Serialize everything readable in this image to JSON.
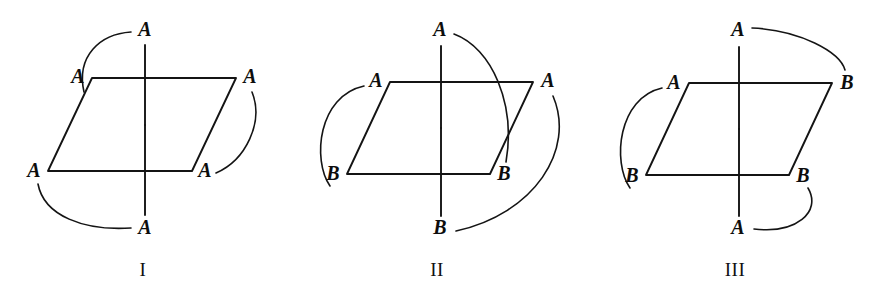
{
  "figure": {
    "background_color": "#ffffff",
    "ink_color": "#141414"
  },
  "structures": [
    {
      "id": "structure-1",
      "caption": "I",
      "caption_pos": {
        "x": 143,
        "y": 272
      },
      "plane": {
        "top_left": {
          "x": 92,
          "y": 78
        },
        "top_right": {
          "x": 236,
          "y": 78
        },
        "bottom_right": {
          "x": 192,
          "y": 171
        },
        "bottom_left": {
          "x": 48,
          "y": 171
        }
      },
      "axis": {
        "center": {
          "x": 145,
          "y": 125
        },
        "top_end": {
          "x": 145,
          "y": 45
        },
        "bottom_end": {
          "x": 145,
          "y": 215
        }
      },
      "labels": [
        {
          "name": "apex-top",
          "text": "A",
          "x": 145,
          "y": 31
        },
        {
          "name": "vertex-top-left",
          "text": "A",
          "x": 78,
          "y": 78
        },
        {
          "name": "vertex-top-right",
          "text": "A",
          "x": 250,
          "y": 78
        },
        {
          "name": "vertex-bottom-left",
          "text": "A",
          "x": 34,
          "y": 172
        },
        {
          "name": "vertex-bottom-right",
          "text": "A",
          "x": 205,
          "y": 172
        },
        {
          "name": "apex-bottom",
          "text": "A",
          "x": 145,
          "y": 229
        }
      ],
      "arcs": [
        {
          "name": "arc-topleft-to-apex-top",
          "d": "M 84 92 C 76 56, 100 34, 131 32"
        },
        {
          "name": "arc-topright-to-bottomright",
          "d": "M 252 92 C 264 122, 246 160, 216 173"
        },
        {
          "name": "arc-bottomleft-to-apex-bottom",
          "d": "M 38 184 C 44 216, 84 231, 131 228"
        }
      ]
    },
    {
      "id": "structure-2",
      "caption": "II",
      "caption_pos": {
        "x": 437,
        "y": 272
      },
      "plane": {
        "top_left": {
          "x": 390,
          "y": 82
        },
        "top_right": {
          "x": 533,
          "y": 82
        },
        "bottom_right": {
          "x": 490,
          "y": 174
        },
        "bottom_left": {
          "x": 347,
          "y": 174
        }
      },
      "axis": {
        "center": {
          "x": 441,
          "y": 128
        },
        "top_end": {
          "x": 441,
          "y": 46
        },
        "bottom_end": {
          "x": 441,
          "y": 216
        }
      },
      "labels": [
        {
          "name": "apex-top",
          "text": "A",
          "x": 440,
          "y": 31
        },
        {
          "name": "vertex-top-left",
          "text": "A",
          "x": 376,
          "y": 82
        },
        {
          "name": "vertex-top-right",
          "text": "A",
          "x": 548,
          "y": 82
        },
        {
          "name": "vertex-bottom-left",
          "text": "B",
          "x": 333,
          "y": 175
        },
        {
          "name": "vertex-bottom-right",
          "text": "B",
          "x": 504,
          "y": 175
        },
        {
          "name": "apex-bottom",
          "text": "B",
          "x": 440,
          "y": 229
        }
      ],
      "arcs": [
        {
          "name": "arc-apex-top-to-bottomright",
          "d": "M 454 34 C 492 48, 516 104, 506 162"
        },
        {
          "name": "arc-topleft-to-bottomleft",
          "d": "M 364 86 C 318 96, 312 160, 330 186"
        },
        {
          "name": "arc-topright-to-apex-bottom",
          "d": "M 553 96 C 576 150, 534 214, 456 231"
        }
      ]
    },
    {
      "id": "structure-3",
      "caption": "III",
      "caption_pos": {
        "x": 735,
        "y": 272
      },
      "plane": {
        "top_left": {
          "x": 689,
          "y": 83
        },
        "top_right": {
          "x": 832,
          "y": 83
        },
        "bottom_right": {
          "x": 789,
          "y": 175
        },
        "bottom_left": {
          "x": 646,
          "y": 175
        }
      },
      "axis": {
        "center": {
          "x": 739,
          "y": 129
        },
        "top_end": {
          "x": 739,
          "y": 47
        },
        "bottom_end": {
          "x": 739,
          "y": 216
        }
      },
      "labels": [
        {
          "name": "apex-top",
          "text": "A",
          "x": 738,
          "y": 31
        },
        {
          "name": "vertex-top-left",
          "text": "A",
          "x": 674,
          "y": 84
        },
        {
          "name": "vertex-top-right",
          "text": "B",
          "x": 847,
          "y": 84
        },
        {
          "name": "vertex-bottom-left",
          "text": "B",
          "x": 632,
          "y": 177
        },
        {
          "name": "vertex-bottom-right",
          "text": "B",
          "x": 803,
          "y": 177
        },
        {
          "name": "apex-bottom",
          "text": "A",
          "x": 738,
          "y": 229
        }
      ],
      "arcs": [
        {
          "name": "arc-apex-top-to-topright",
          "d": "M 752 28 C 800 30, 840 52, 845 70"
        },
        {
          "name": "arc-topleft-to-bottomleft",
          "d": "M 662 88 C 618 98, 612 162, 630 188"
        },
        {
          "name": "arc-bottomright-to-apex-bottom",
          "d": "M 808 188 C 822 212, 796 234, 754 229"
        }
      ]
    }
  ]
}
